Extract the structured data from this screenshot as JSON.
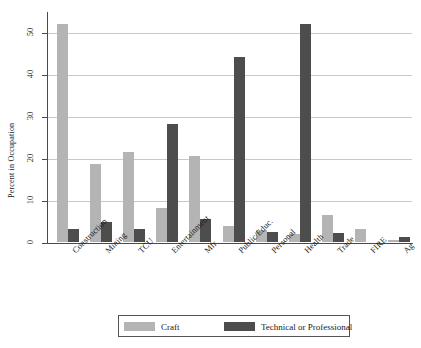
{
  "chart_data": {
    "type": "bar",
    "title": "",
    "xlabel": "",
    "ylabel": "Percent in Occupation",
    "ylim": [
      0,
      55
    ],
    "yticks": [
      0,
      10,
      20,
      30,
      40,
      50
    ],
    "grid": true,
    "legend_position": "bottom",
    "categories": [
      "Construction",
      "Mining",
      "TCU",
      "Entertainment",
      "Mfr",
      "Public/Educ.",
      "Personal",
      "Health",
      "Trade",
      "FIRE",
      "Ag"
    ],
    "series": [
      {
        "name": "Craft",
        "color": "#b4b4b4",
        "values": [
          52.0,
          18.5,
          21.5,
          8.2,
          20.4,
          3.8,
          2.8,
          2.0,
          6.5,
          3.0,
          0.5
        ]
      },
      {
        "name": "Technical or Professional",
        "color": "#4d4d4d",
        "values": [
          3.0,
          4.8,
          3.2,
          28.0,
          5.5,
          44.0,
          2.5,
          52.0,
          2.1,
          0.0,
          1.3
        ]
      }
    ]
  },
  "legend": {
    "entries": [
      {
        "label": "Craft"
      },
      {
        "label": "Technical or Professional"
      }
    ]
  }
}
